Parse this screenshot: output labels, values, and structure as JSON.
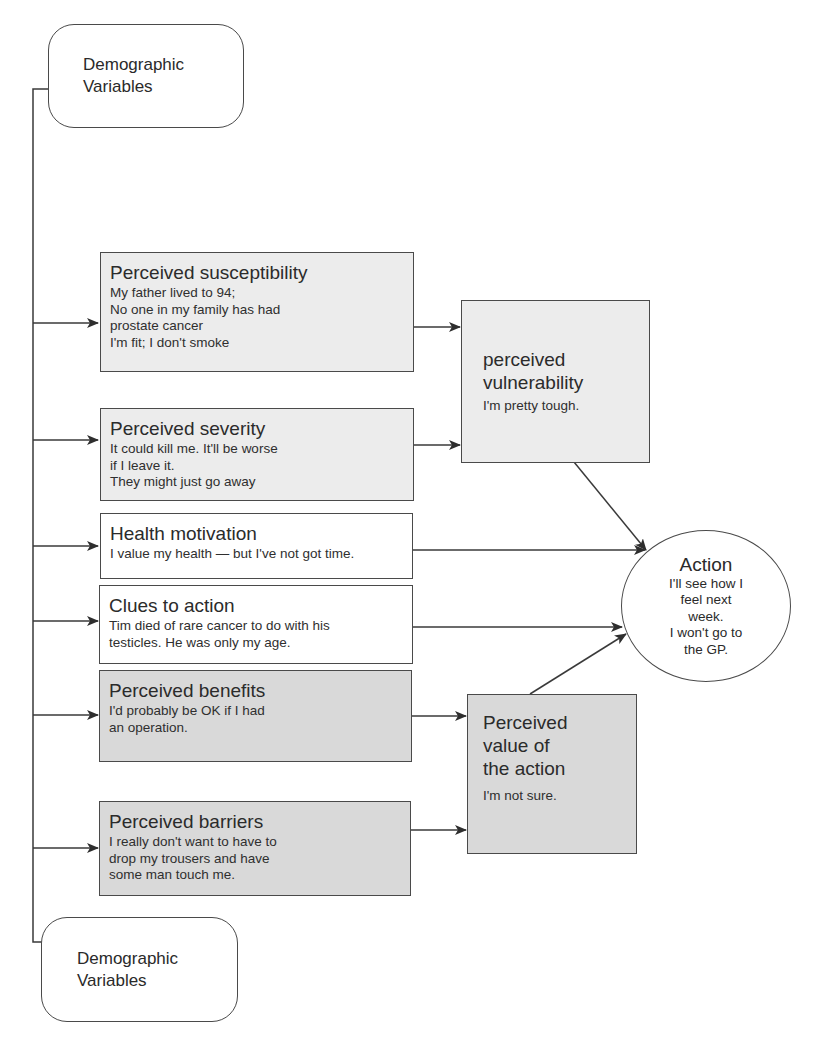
{
  "diagram": {
    "type": "health-belief-model",
    "demographic_top": {
      "title_lines": [
        "Demographic",
        "Variables"
      ]
    },
    "demographic_bottom": {
      "title_lines": [
        "Demographic",
        "Variables"
      ]
    },
    "factors": [
      {
        "id": "susceptibility",
        "title": "Perceived susceptibility",
        "body_lines": [
          "My father lived to 94;",
          "No one in my family has had",
          "prostate cancer",
          "I'm fit; I don't smoke"
        ]
      },
      {
        "id": "severity",
        "title": "Perceived severity",
        "body_lines": [
          "It could kill me. It'll be worse",
          "if I leave it.",
          "They might just go away"
        ]
      },
      {
        "id": "health-motivation",
        "title": "Health motivation",
        "body_lines": [
          "I value my health — but I've not got time."
        ]
      },
      {
        "id": "clues",
        "title": "Clues to action",
        "body_lines": [
          "Tim died of rare cancer to do with his",
          "testicles. He was only my age."
        ]
      },
      {
        "id": "benefits",
        "title": "Perceived benefits",
        "body_lines": [
          "I'd probably be OK if I had",
          "an operation."
        ]
      },
      {
        "id": "barriers",
        "title": "Perceived barriers",
        "body_lines": [
          "I really don't want to have to",
          "drop my trousers and have",
          "some man touch me."
        ]
      }
    ],
    "vulnerability": {
      "title_lines": [
        "perceived",
        "vulnerability"
      ],
      "body": "I'm pretty tough."
    },
    "value": {
      "title_lines": [
        "Perceived",
        "value of",
        "the action"
      ],
      "body": "I'm not sure."
    },
    "action": {
      "title": "Action",
      "body_lines": [
        "I'll see how I",
        "feel next",
        "week.",
        "I won't go to",
        "the GP."
      ]
    },
    "colors": {
      "line": "#3a3a3a",
      "light_fill": "#ececec",
      "dark_fill": "#d9d9d9",
      "white_fill": "#ffffff"
    }
  }
}
